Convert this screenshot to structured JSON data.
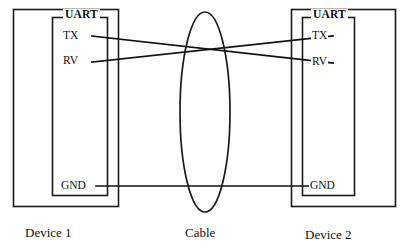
{
  "figure": {
    "background_color": "#ffffff",
    "line_color": "#111111"
  },
  "devices": [
    {
      "id": "device-1",
      "caption": "Device 1",
      "uart_label": "UART",
      "pins": [
        {
          "name": "TX",
          "label": "TX"
        },
        {
          "name": "RV",
          "label": "RV"
        },
        {
          "name": "GND",
          "label": "GND"
        }
      ]
    },
    {
      "id": "device-2",
      "caption": "Device 2",
      "uart_label": "UART",
      "pins": [
        {
          "name": "TX",
          "label": "TX"
        },
        {
          "name": "RV",
          "label": "RV"
        },
        {
          "name": "GND",
          "label": "GND"
        }
      ]
    }
  ],
  "cable": {
    "caption": "Cable",
    "shape": "ellipse"
  },
  "connections": [
    {
      "name": "tx1-to-rv2",
      "from": "Device 1 TX",
      "to": "Device 2 RV"
    },
    {
      "name": "rv1-to-tx2",
      "from": "Device 1 RV",
      "to": "Device 2 TX"
    },
    {
      "name": "gnd1-to-gnd2",
      "from": "Device 1 GND",
      "to": "Device 2 GND"
    }
  ]
}
